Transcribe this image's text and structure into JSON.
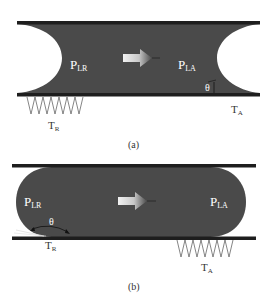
{
  "figure": {
    "colors": {
      "fluid": "#4a4a4a",
      "wall": "#1e1e1e",
      "background": "#ffffff",
      "arrow_light": "#eeeeee",
      "arrow_dark": "#555555",
      "label_on_fluid": "#ffffff",
      "label_outside": "#333333"
    },
    "panel_a": {
      "caption": "(a)",
      "left_pressure": {
        "main": "P",
        "sub": "LR"
      },
      "right_pressure": {
        "main": "P",
        "sub": "LA"
      },
      "angle_label": "θ",
      "receding_tension": {
        "main": "T",
        "sub": "R"
      },
      "advancing_tension": {
        "main": "T",
        "sub": "A"
      },
      "meniscus_shape": "concave"
    },
    "panel_b": {
      "caption": "(b)",
      "left_pressure": {
        "main": "P",
        "sub": "LR"
      },
      "right_pressure": {
        "main": "P",
        "sub": "LA"
      },
      "angle_label": "θ",
      "receding_tension": {
        "main": "T",
        "sub": "R"
      },
      "advancing_tension": {
        "main": "T",
        "sub": "A"
      },
      "meniscus_shape": "convex"
    }
  }
}
